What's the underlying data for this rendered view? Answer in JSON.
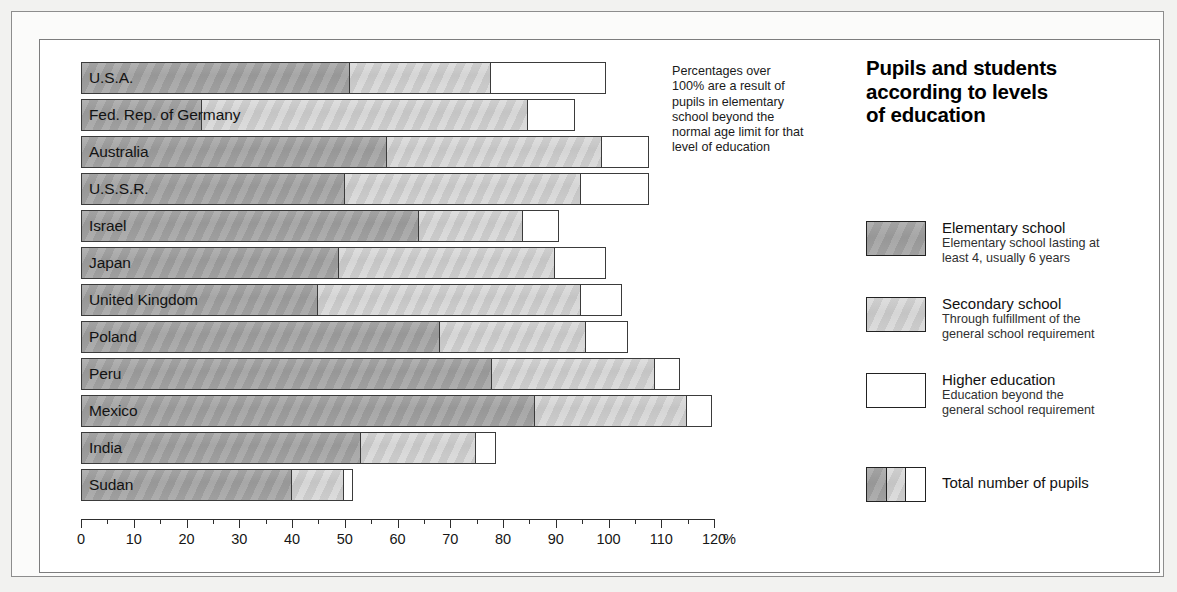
{
  "title": {
    "line1": "Pupils and students",
    "line2": "according to levels",
    "line3": "of education"
  },
  "note": {
    "line1": "Percentages over",
    "line2": "100% are a result of",
    "line3": "pupils in elementary",
    "line4": "school beyond the",
    "line5": "normal age limit for that",
    "line6": "level of education"
  },
  "axis": {
    "unit": "%",
    "ticks": [
      "0",
      "10",
      "20",
      "30",
      "40",
      "50",
      "60",
      "70",
      "80",
      "90",
      "100",
      "110",
      "120"
    ]
  },
  "legend": {
    "items": [
      {
        "swatch": "elementary-swatch",
        "title": "Elementary school",
        "sub1": "Elementary school lasting at",
        "sub2": "least 4, usually 6 years"
      },
      {
        "swatch": "secondary-swatch",
        "title": "Secondary school",
        "sub1": "Through fulfillment of the",
        "sub2": "general school requirement"
      },
      {
        "swatch": "higher-swatch",
        "title": "Higher education",
        "sub1": "Education beyond the",
        "sub2": "general school requirement"
      }
    ],
    "total": {
      "swatch": "total-swatch",
      "title": "Total number of pupils"
    }
  },
  "chart_data": {
    "type": "bar",
    "orientation": "horizontal",
    "stacked": true,
    "title": "Pupils and students according to levels of education",
    "xlabel": "%",
    "ylabel": "",
    "xlim": [
      0,
      120
    ],
    "grid": false,
    "legend_position": "right",
    "tick_step": 10,
    "minor_tick_step": 5,
    "categories": [
      "U.S.A.",
      "Fed. Rep. of Germany",
      "Australia",
      "U.S.S.R.",
      "Israel",
      "Japan",
      "United Kingdom",
      "Poland",
      "Peru",
      "Mexico",
      "India",
      "Sudan"
    ],
    "series": [
      {
        "name": "Elementary school",
        "color": "#a2a2a2",
        "values": [
          51,
          23,
          58,
          50,
          64,
          49,
          45,
          68,
          78,
          86,
          53,
          40
        ]
      },
      {
        "name": "Secondary school",
        "color": "#cfcfcf",
        "values": [
          27,
          62,
          41,
          45,
          20,
          41,
          50,
          28,
          31,
          29,
          22,
          10
        ]
      },
      {
        "name": "Higher education",
        "color": "#ffffff",
        "values": [
          22,
          9,
          9,
          13,
          7,
          10,
          8,
          8,
          5,
          5,
          4,
          2
        ]
      }
    ],
    "totals": [
      100,
      94,
      108,
      108,
      91,
      100,
      103,
      104,
      114,
      120,
      79,
      52
    ]
  }
}
